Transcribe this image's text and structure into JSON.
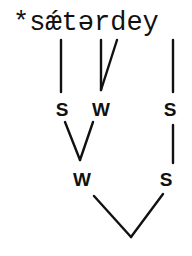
{
  "diagram": {
    "type": "metrical-tree",
    "word": "*sǽtərdey",
    "leaf_groups": [
      {
        "segments": "s",
        "label": "S"
      },
      {
        "segments": "ǽtə",
        "label": "W"
      },
      {
        "segments": "y",
        "label": "S"
      }
    ],
    "level1": [
      {
        "label": "S",
        "parent_label": "W"
      },
      {
        "label": "W",
        "parent_label": "W"
      },
      {
        "label": "S",
        "parent_label": "S"
      }
    ],
    "level2": [
      {
        "label": "W"
      },
      {
        "label": "S"
      }
    ],
    "root": {
      "label": ""
    },
    "labels": {
      "l1_left": "S",
      "l1_mid": "W",
      "l1_right": "S",
      "l2_left": "W",
      "l2_right": "S"
    },
    "colors": {
      "ink": "#111111",
      "background": "#ffffff"
    }
  }
}
